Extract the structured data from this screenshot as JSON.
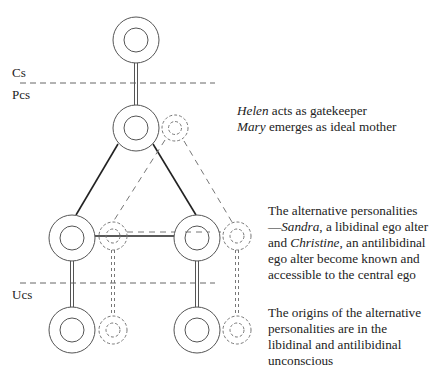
{
  "levels": {
    "conscious": "Cs",
    "preconscious": "Pcs",
    "unconscious": "Ucs"
  },
  "annotations": {
    "gatekeeper": {
      "name1": "Helen",
      "text1": " acts as gatekeeper",
      "name2": "Mary",
      "text2": " emerges as ideal mother"
    },
    "alternatives": {
      "intro": "The alternative personalities—",
      "name1": "Sandra",
      "text1": ", a libidinal ego alter and ",
      "name2": "Christine",
      "text2": ", an antilibidinal ego alter become known and accessible to the central ego"
    },
    "origins": {
      "text": "The origins of the alternative personalities are in the libidinal and antilibidinal unconscious"
    }
  },
  "colors": {
    "stroke": "#555555",
    "solid_line": "#222222",
    "dashed": "#666666"
  }
}
